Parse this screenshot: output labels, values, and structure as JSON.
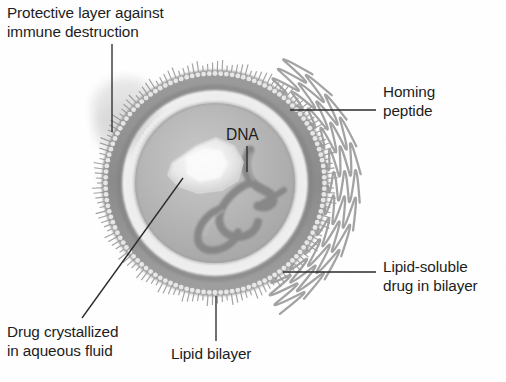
{
  "figure": {
    "background_color": "#ffffff",
    "text_color": "#1d1d1d",
    "leader_color": "#2b2b2b"
  },
  "labels": {
    "protective_layer": "Protective layer against\nimmune destruction",
    "homing_peptide": "Homing\npeptide",
    "lipid_soluble_drug": "Lipid-soluble\ndrug in bilayer",
    "lipid_bilayer": "Lipid bilayer",
    "drug_crystallized": "Drug crystallized\nin aqueous fluid",
    "dna": "DNA"
  },
  "structure": {
    "center_x": 215,
    "center_y": 183,
    "outer_radius": 115,
    "bilayer_outer_radius": 103,
    "bilayer_inner_radius": 84,
    "core_radius": 78,
    "fringe_count": 150,
    "peptide_count": 11,
    "bead_count": 120
  },
  "colors": {
    "halo": "#e9e9e9",
    "fringe": "#9c9c9c",
    "bilayer_dark": "#8f8f8f",
    "bilayer_mid": "#a8a8a8",
    "bead_light": "#ededed",
    "core": "#b4b4b4",
    "core_light": "#c4c4c4",
    "crystal": "#f2f2f2",
    "dna_dark": "#7d7d7d",
    "peptide": "#a0a0a0"
  }
}
